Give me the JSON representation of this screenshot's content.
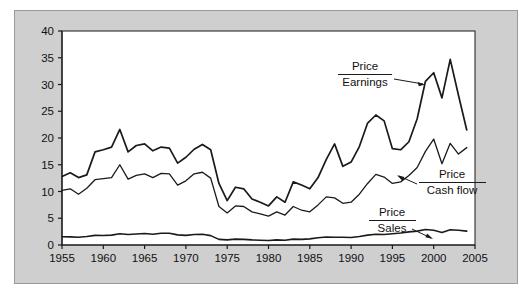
{
  "figure": {
    "panel_bg": "#cfcfcf",
    "plot_bg": "#ffffff",
    "border_color": "#9a9a9a",
    "line_color": "#1a1a1a"
  },
  "annotations": {
    "pe": {
      "numerator": "Price",
      "denominator": "Earnings"
    },
    "pcf": {
      "numerator": "Price",
      "denominator": "Cash flow"
    },
    "ps": {
      "numerator": "Price",
      "denominator": "Sales"
    }
  },
  "chart_data": {
    "type": "line",
    "title": "",
    "xlabel": "",
    "ylabel": "",
    "xlim": [
      1955,
      2005
    ],
    "ylim": [
      0,
      40
    ],
    "grid": false,
    "legend_position": "inline-annotations",
    "xticks": [
      1955,
      1960,
      1965,
      1970,
      1975,
      1980,
      1985,
      1990,
      1995,
      2000,
      2005
    ],
    "yticks": [
      0,
      5,
      10,
      15,
      20,
      25,
      30,
      35,
      40
    ],
    "x": [
      1955,
      1956,
      1957,
      1958,
      1959,
      1960,
      1961,
      1962,
      1963,
      1964,
      1965,
      1966,
      1967,
      1968,
      1969,
      1970,
      1971,
      1972,
      1973,
      1974,
      1975,
      1976,
      1977,
      1978,
      1979,
      1980,
      1981,
      1982,
      1983,
      1984,
      1985,
      1986,
      1987,
      1988,
      1989,
      1990,
      1991,
      1992,
      1993,
      1994,
      1995,
      1996,
      1997,
      1998,
      1999,
      2000,
      2001,
      2002,
      2003,
      2004
    ],
    "series": [
      {
        "name": "Price / Earnings",
        "label_numerator": "Price",
        "label_denominator": "Earnings",
        "stroke_width": 1.7,
        "values": [
          12.8,
          13.5,
          12.6,
          13.1,
          17.4,
          17.8,
          18.3,
          21.6,
          17.4,
          18.6,
          18.9,
          17.6,
          18.3,
          18.1,
          15.3,
          16.4,
          17.9,
          18.8,
          17.8,
          11.5,
          8.3,
          10.8,
          10.5,
          8.6,
          8.0,
          7.3,
          9.0,
          8.0,
          11.8,
          11.2,
          10.5,
          12.6,
          16.0,
          18.9,
          14.7,
          15.5,
          18.4,
          22.8,
          24.3,
          23.2,
          18.0,
          17.8,
          19.3,
          23.6,
          30.6,
          32.2,
          27.5,
          34.7,
          28.0,
          21.5
        ]
      },
      {
        "name": "Price / Cash flow",
        "label_numerator": "Price",
        "label_denominator": "Cash flow",
        "stroke_width": 1.3,
        "values": [
          10.2,
          10.5,
          9.5,
          10.6,
          12.2,
          12.4,
          12.6,
          15.0,
          12.3,
          13.0,
          13.3,
          12.6,
          13.4,
          13.3,
          11.2,
          12.0,
          13.3,
          13.6,
          12.5,
          7.2,
          6.0,
          7.3,
          7.2,
          6.2,
          5.8,
          5.4,
          6.2,
          5.6,
          7.2,
          6.5,
          6.2,
          7.5,
          9.0,
          8.8,
          7.8,
          8.0,
          9.5,
          11.5,
          13.2,
          12.7,
          11.5,
          11.8,
          13.0,
          14.5,
          17.5,
          19.8,
          15.2,
          19.0,
          17.0,
          18.2
        ]
      },
      {
        "name": "Price / Sales",
        "label_numerator": "Price",
        "label_denominator": "Sales",
        "stroke_width": 1.6,
        "values": [
          1.55,
          1.52,
          1.45,
          1.6,
          1.8,
          1.78,
          1.85,
          2.1,
          1.95,
          2.05,
          2.15,
          2.0,
          2.2,
          2.2,
          1.9,
          1.8,
          1.95,
          2.0,
          1.75,
          1.05,
          0.95,
          1.1,
          1.05,
          0.95,
          0.9,
          0.85,
          0.95,
          0.9,
          1.1,
          1.05,
          1.15,
          1.35,
          1.5,
          1.45,
          1.45,
          1.4,
          1.6,
          1.85,
          2.0,
          1.95,
          2.1,
          2.25,
          2.45,
          2.6,
          2.9,
          2.75,
          2.35,
          2.85,
          2.75,
          2.6
        ]
      }
    ]
  }
}
